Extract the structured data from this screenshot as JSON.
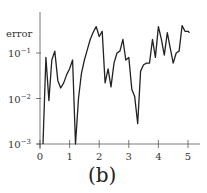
{
  "chart_data": {
    "type": "line",
    "title": "",
    "caption": "(b)",
    "xlabel": "",
    "ylabel": "error",
    "yscale": "log",
    "xlim": [
      0,
      5.4
    ],
    "ylim": [
      0.001,
      0.8
    ],
    "grid": false,
    "x_ticks": [
      0,
      1,
      2,
      3,
      4,
      5
    ],
    "x_tick_labels": [
      "0",
      "1",
      "2",
      "3",
      "4",
      "5"
    ],
    "y_ticks": [
      0.001,
      0.01,
      0.1
    ],
    "y_tick_labels": [
      {
        "base": "10",
        "exp": "−3"
      },
      {
        "base": "10",
        "exp": "−2"
      },
      {
        "base": "10",
        "exp": "−1"
      }
    ],
    "series": [
      {
        "name": "error",
        "color": "#222222",
        "x": [
          0.1,
          0.2,
          0.3,
          0.4,
          0.5,
          0.6,
          0.7,
          0.8,
          0.9,
          1.0,
          1.1,
          1.2,
          1.3,
          1.4,
          1.5,
          1.6,
          1.7,
          1.8,
          1.9,
          2.0,
          2.1,
          2.2,
          2.3,
          2.4,
          2.5,
          2.6,
          2.7,
          2.8,
          2.9,
          3.0,
          3.1,
          3.2,
          3.3,
          3.4,
          3.5,
          3.6,
          3.7,
          3.8,
          3.9,
          4.0,
          4.1,
          4.2,
          4.3,
          4.4,
          4.5,
          4.6,
          4.7,
          4.8,
          4.9,
          5.0,
          5.05
        ],
        "y": [
          0.001,
          0.08,
          0.009,
          0.07,
          0.11,
          0.025,
          0.017,
          0.022,
          0.033,
          0.045,
          0.07,
          0.001,
          0.01,
          0.035,
          0.07,
          0.12,
          0.2,
          0.29,
          0.38,
          0.23,
          0.3,
          0.022,
          0.045,
          0.018,
          0.06,
          0.1,
          0.11,
          0.2,
          0.07,
          0.08,
          0.016,
          0.011,
          0.0028,
          0.04,
          0.055,
          0.06,
          0.06,
          0.2,
          0.08,
          0.38,
          0.2,
          0.09,
          0.28,
          0.13,
          0.06,
          0.1,
          0.11,
          0.4,
          0.3,
          0.3,
          0.28
        ]
      }
    ]
  }
}
